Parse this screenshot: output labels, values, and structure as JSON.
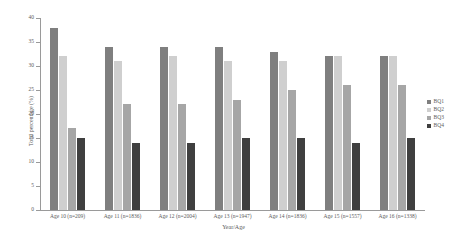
{
  "chart_data": {
    "type": "bar",
    "title": "",
    "xlabel": "Year/Age",
    "ylabel": "Total percentage (%)",
    "ylim": [
      0,
      40
    ],
    "yticks": [
      0,
      5,
      10,
      15,
      20,
      25,
      30,
      35,
      40
    ],
    "ytick_labels": [
      "0",
      "5",
      "10",
      "15",
      "20",
      "25",
      "30",
      "35",
      "40"
    ],
    "grid": false,
    "legend_position": "right",
    "categories": [
      "Age 10 (n=209)",
      "Age 11 (n=1836)",
      "Age 12 (n=2004)",
      "Age 13 (n=1947)",
      "Age 14 (n=1836)",
      "Age 15 (n=1557)",
      "Age 16 (n=1338)"
    ],
    "series": [
      {
        "name": "BQ1",
        "color": "#7f7f7f",
        "values": [
          38,
          34,
          34,
          34,
          33,
          32,
          32
        ]
      },
      {
        "name": "BQ2",
        "color": "#cfcfcf",
        "values": [
          32,
          31,
          32,
          31,
          31,
          32,
          32
        ]
      },
      {
        "name": "BQ3",
        "color": "#a6a6a6",
        "values": [
          17,
          22,
          22,
          23,
          25,
          26,
          26
        ]
      },
      {
        "name": "BQ4",
        "color": "#3f3f3f",
        "values": [
          15,
          14,
          14,
          15,
          15,
          14,
          15
        ]
      }
    ]
  },
  "legend": {
    "items": [
      {
        "label": "BQ1",
        "color": "#7f7f7f"
      },
      {
        "label": "BQ2",
        "color": "#cfcfcf"
      },
      {
        "label": "BQ3",
        "color": "#a6a6a6"
      },
      {
        "label": "BQ4",
        "color": "#3f3f3f"
      }
    ]
  }
}
